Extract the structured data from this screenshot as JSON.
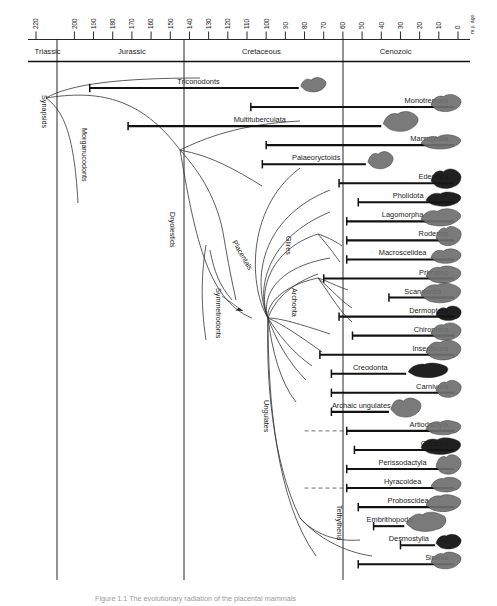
{
  "figure": {
    "caption": "Figure 1.1  The evolutionary radiation of the placental mammals",
    "axis_unit": "m.y. ago",
    "axis_min": 0,
    "axis_max": 228
  },
  "chart_data": {
    "type": "table",
    "title": "The evolutionary radiation of the placental mammals",
    "xlabel": "m.y. ago",
    "ylabel": "",
    "xlim": [
      228,
      0
    ],
    "grid": false,
    "legend": "none",
    "axis_ticks": [
      220,
      200,
      190,
      180,
      170,
      160,
      150,
      140,
      130,
      120,
      110,
      100,
      90,
      80,
      70,
      60,
      50,
      40,
      30,
      20,
      10,
      0
    ],
    "eras": [
      {
        "name": "Triassic",
        "start": 228,
        "end": 200
      },
      {
        "name": "Jurassic",
        "start": 200,
        "end": 140
      },
      {
        "name": "Cretaceous",
        "start": 140,
        "end": 65
      },
      {
        "name": "Cenozoic",
        "start": 65,
        "end": 0
      }
    ],
    "taxa": [
      {
        "label": "Triconodonts",
        "bar_start": 192,
        "bar_end": 83,
        "label_x": 122,
        "label_side": "right",
        "silhouette": true
      },
      {
        "label": "Monotremata",
        "bar_start": 108,
        "bar_end": 2,
        "label_x": 48,
        "label_side": "left",
        "silhouette": true
      },
      {
        "label": "Multituberculata",
        "bar_start": 172,
        "bar_end": 40,
        "label_x": 84,
        "label_side": "right",
        "silhouette": true
      },
      {
        "label": "Marsupialia",
        "bar_start": 100,
        "bar_end": 2,
        "label_x": 55,
        "label_side": "left",
        "silhouette": true
      },
      {
        "label": "Palaeoryctoids",
        "bar_start": 102,
        "bar_end": 48,
        "label_x": 88,
        "label_side": "right",
        "silhouette": true
      },
      {
        "label": "Edentata",
        "bar_start": 62,
        "bar_end": 2,
        "label_x": 38,
        "label_side": "left",
        "silhouette": true
      },
      {
        "label": "Pholidota",
        "bar_start": 52,
        "bar_end": 2,
        "label_x": 52,
        "label_side": "right",
        "silhouette": true
      },
      {
        "label": "Lagomorpha",
        "bar_start": 58,
        "bar_end": 2,
        "label_x": 58,
        "label_side": "right",
        "silhouette": true
      },
      {
        "label": "Rodentia",
        "bar_start": 58,
        "bar_end": 2,
        "label_x": 46,
        "label_side": "left",
        "silhouette": true
      },
      {
        "label": "Macroscelidea",
        "bar_start": 58,
        "bar_end": 2,
        "label_x": 52,
        "label_side": "right",
        "silhouette": true
      },
      {
        "label": "Primates",
        "bar_start": 70,
        "bar_end": 2,
        "label_x": 48,
        "label_side": "left",
        "silhouette": true
      },
      {
        "label": "Scandentia",
        "bar_start": 36,
        "bar_end": 2,
        "label_x": 44,
        "label_side": "right",
        "silhouette": true
      },
      {
        "label": "Dermoptera",
        "bar_start": 62,
        "bar_end": 2,
        "label_x": 50,
        "label_side": "left",
        "silhouette": true
      },
      {
        "label": "Chiroptera",
        "bar_start": 55,
        "bar_end": 2,
        "label_x": 44,
        "label_side": "left",
        "silhouette": true
      },
      {
        "label": "Insectivora",
        "bar_start": 72,
        "bar_end": 2,
        "label_x": 48,
        "label_side": "left",
        "silhouette": true
      },
      {
        "label": "Creodonta",
        "bar_start": 66,
        "bar_end": 27,
        "label_x": 60,
        "label_side": "right",
        "silhouette": true
      },
      {
        "label": "Carnivora",
        "bar_start": 66,
        "bar_end": 2,
        "label_x": 36,
        "label_side": "left",
        "silhouette": true
      },
      {
        "label": "Archaic ungulates",
        "bar_start": 66,
        "bar_end": 36,
        "label_x": 70,
        "label_side": "right",
        "silhouette": true
      },
      {
        "label": "Artiodactyla",
        "bar_start": 58,
        "bar_end": 2,
        "label_x": 36,
        "label_side": "left",
        "silhouette": true
      },
      {
        "label": "Cetacea",
        "bar_start": 54,
        "bar_end": 2,
        "label_x": 46,
        "label_side": "left",
        "silhouette": true
      },
      {
        "label": "Perissodactyla",
        "bar_start": 58,
        "bar_end": 2,
        "label_x": 52,
        "label_side": "right",
        "silhouette": true
      },
      {
        "label": "Hyracoidea",
        "bar_start": 58,
        "bar_end": 2,
        "label_x": 48,
        "label_side": "right",
        "silhouette": true
      },
      {
        "label": "Proboscidea",
        "bar_start": 52,
        "bar_end": 2,
        "label_x": 46,
        "label_side": "right",
        "silhouette": true
      },
      {
        "label": "Embrithopoda",
        "bar_start": 44,
        "bar_end": 28,
        "label_x": 48,
        "label_side": "right",
        "silhouette": true
      },
      {
        "label": "Desmostylia",
        "bar_start": 30,
        "bar_end": 12,
        "label_x": 26,
        "label_side": "left",
        "silhouette": true
      },
      {
        "label": "Sirenia",
        "bar_start": 52,
        "bar_end": 2,
        "label_x": 22,
        "label_side": "left",
        "silhouette": true
      }
    ],
    "clade_labels": [
      {
        "text": "Synapsids",
        "rotated": true
      },
      {
        "text": "Morganucodonts",
        "rotated": true
      },
      {
        "text": "Dryolestids",
        "rotated": true
      },
      {
        "text": "Symmetrodonts",
        "rotated": true
      },
      {
        "text": "Placentals",
        "rotated": true
      },
      {
        "text": "Glires",
        "rotated": true
      },
      {
        "text": "Archonta",
        "rotated": true
      },
      {
        "text": "Ungulates",
        "rotated": true
      },
      {
        "text": "Tethytheria",
        "rotated": true
      }
    ],
    "annotations": [
      "Dashed horizontal lines indicate uncertain/inferred range extensions",
      "Animal silhouettes shown at the right of each range bar"
    ]
  }
}
